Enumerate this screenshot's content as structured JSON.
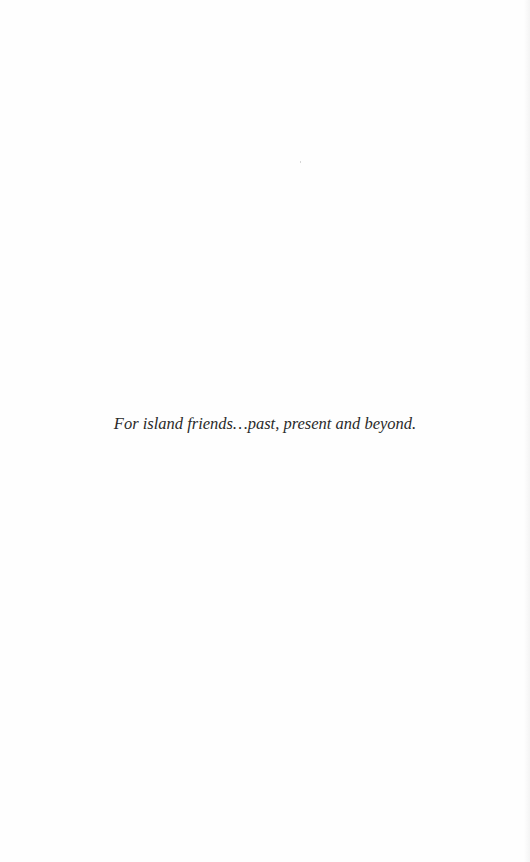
{
  "page": {
    "dedication": "For island friends…past, present and beyond."
  },
  "colors": {
    "background": "#fefefe",
    "text": "#2a2a2a"
  }
}
